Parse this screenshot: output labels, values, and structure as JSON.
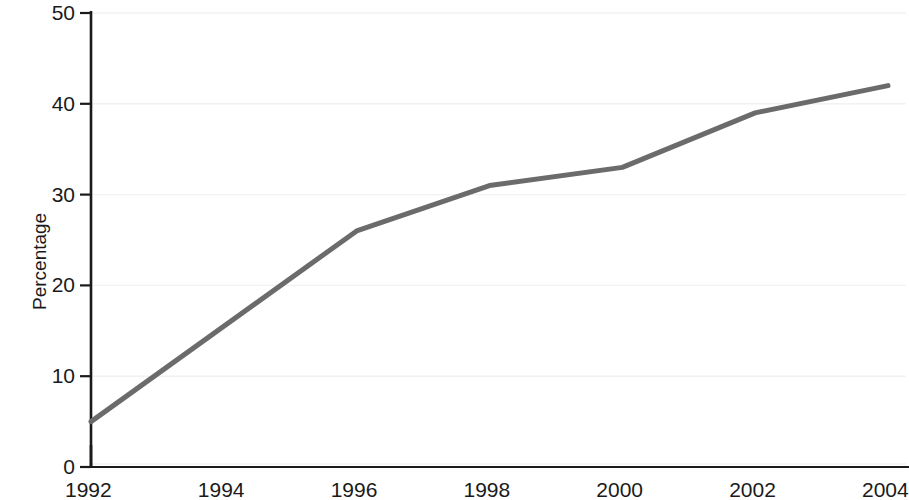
{
  "chart_data": {
    "type": "line",
    "title": "",
    "subtitle": "",
    "xlabel": "",
    "ylabel": "Percentage",
    "x": [
      1992,
      1996,
      1998,
      2000,
      2002,
      2004
    ],
    "values": [
      5,
      26,
      31,
      33,
      39,
      42
    ],
    "series": [
      {
        "name": "Percentage",
        "x": [
          1992,
          1996,
          1998,
          2000,
          2002,
          2004
        ],
        "values": [
          5,
          26,
          31,
          33,
          39,
          42
        ]
      }
    ],
    "xlim": [
      1992,
      2004
    ],
    "ylim": [
      0,
      50
    ],
    "x_tick_labels": [
      "1992",
      "1994",
      "1996",
      "1998",
      "2000",
      "2002",
      "2004"
    ],
    "x_tick_values": [
      1992,
      1994,
      1996,
      1998,
      2000,
      2002,
      2004
    ],
    "y_tick_labels": [
      "0",
      "10",
      "20",
      "30",
      "40",
      "50"
    ],
    "y_tick_values": [
      0,
      10,
      20,
      30,
      40,
      50
    ],
    "grid": "horizontal-faint",
    "legend": "none",
    "line_color": "#6b6b6b",
    "axis_color": "#1a1a1a",
    "grid_color": "#f2f2f2",
    "line_width": 5,
    "annotations": []
  },
  "axes": {
    "y_title": "Percentage"
  }
}
